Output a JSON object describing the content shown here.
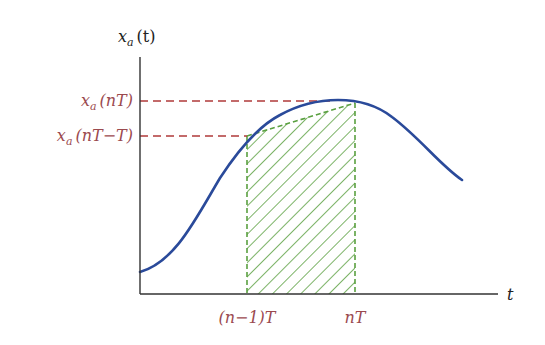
{
  "diagram": {
    "y_axis_label": "x_a(t)",
    "y_axis_label_main": "x",
    "y_axis_label_sub": "a",
    "y_axis_label_arg": "(t)",
    "x_axis_label": "t",
    "y_markers": [
      {
        "main": "x",
        "sub": "a",
        "arg": "(nT)",
        "full": "x_a(nT)"
      },
      {
        "main": "x",
        "sub": "a",
        "arg": "(nT−T)",
        "full": "x_a(nT−T)"
      }
    ],
    "x_markers": [
      {
        "label": "(n−1)T"
      },
      {
        "label": "nT"
      }
    ],
    "colors": {
      "curve": "#2a4a9a",
      "hatch": "#5aa040",
      "dashed_guides": "#b03a3a",
      "marker_labels": "#9b4a4f",
      "axes": "#333333"
    }
  }
}
